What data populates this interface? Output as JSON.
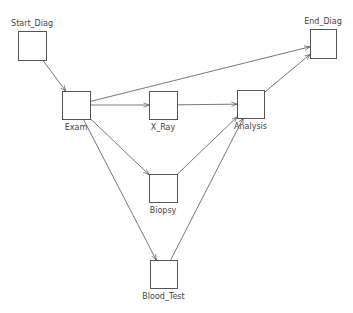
{
  "diagram": {
    "type": "workflow-graph",
    "nodes": [
      {
        "id": "start",
        "label": "Start_Diag",
        "x": 18,
        "y": 31,
        "w": 28,
        "h": 29,
        "label_pos": "top"
      },
      {
        "id": "exam",
        "label": "Exam",
        "x": 62,
        "y": 91,
        "w": 28,
        "h": 28,
        "label_pos": "bottom"
      },
      {
        "id": "xray",
        "label": "X_Ray",
        "x": 149,
        "y": 91,
        "w": 28,
        "h": 28,
        "label_pos": "bottom"
      },
      {
        "id": "analysis",
        "label": "Analysis",
        "x": 237,
        "y": 90,
        "w": 27,
        "h": 28,
        "label_pos": "bottom"
      },
      {
        "id": "end",
        "label": "End_Diag",
        "x": 310,
        "y": 29,
        "w": 26,
        "h": 29,
        "label_pos": "top"
      },
      {
        "id": "biopsy",
        "label": "Biopsy",
        "x": 149,
        "y": 174,
        "w": 28,
        "h": 28,
        "label_pos": "bottom"
      },
      {
        "id": "blood",
        "label": "Blood_Test",
        "x": 150,
        "y": 260,
        "w": 27,
        "h": 28,
        "label_pos": "bottom"
      }
    ],
    "edges": [
      {
        "from": "start",
        "to": "exam"
      },
      {
        "from": "exam",
        "to": "end"
      },
      {
        "from": "exam",
        "to": "xray"
      },
      {
        "from": "exam",
        "to": "biopsy"
      },
      {
        "from": "exam",
        "to": "blood"
      },
      {
        "from": "xray",
        "to": "analysis"
      },
      {
        "from": "biopsy",
        "to": "analysis"
      },
      {
        "from": "blood",
        "to": "analysis"
      },
      {
        "from": "analysis",
        "to": "end"
      }
    ],
    "colors": {
      "stroke": "#555555",
      "text": "#444444",
      "background": "#ffffff"
    }
  }
}
